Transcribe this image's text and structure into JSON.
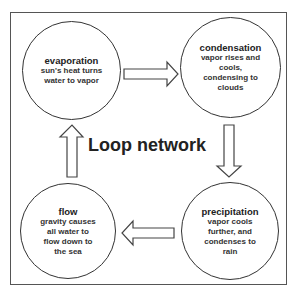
{
  "diagram": {
    "title": "Loop network",
    "nodes": [
      {
        "id": "evaporation",
        "title": "evaporation",
        "desc_lines": [
          "sun's heat turns",
          "water to vapor"
        ]
      },
      {
        "id": "condensation",
        "title": "condensation",
        "desc_lines": [
          "vapor rises and",
          "cools,",
          "condensing to",
          "clouds"
        ]
      },
      {
        "id": "precipitation",
        "title": "precipitation",
        "desc_lines": [
          "vapor cools",
          "further, and",
          "condenses to",
          "rain"
        ]
      },
      {
        "id": "flow",
        "title": "flow",
        "desc_lines": [
          "gravity causes",
          "all water to",
          "flow down to",
          "the sea"
        ]
      }
    ],
    "edges": [
      {
        "from": "evaporation",
        "to": "condensation",
        "direction": "right"
      },
      {
        "from": "condensation",
        "to": "precipitation",
        "direction": "down"
      },
      {
        "from": "precipitation",
        "to": "flow",
        "direction": "left"
      },
      {
        "from": "flow",
        "to": "evaporation",
        "direction": "up"
      }
    ],
    "colors": {
      "stroke": "#333333",
      "background": "#ffffff",
      "text": "#222222"
    }
  }
}
